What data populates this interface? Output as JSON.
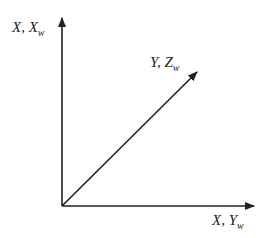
{
  "diagram": {
    "title": "",
    "axes": [
      {
        "id": "vertical",
        "label_main": "X, X",
        "label_sub": "w",
        "direction": "up"
      },
      {
        "id": "diagonal",
        "label_main": "Y, Z",
        "label_sub": "w",
        "direction": "up-right"
      },
      {
        "id": "horizontal",
        "label_main": "X, Y",
        "label_sub": "w",
        "direction": "right"
      }
    ],
    "colors": {
      "line": "#222222",
      "background": "#ffffff"
    }
  }
}
